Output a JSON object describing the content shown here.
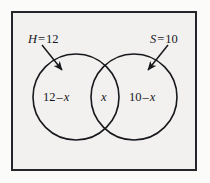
{
  "figure": {
    "frame": {
      "name": "universal-set-rectangle",
      "stroke_color": "#25262a",
      "fill_color": "#f2f1f0"
    },
    "background_color": "#fbfbfa",
    "stroke_color": "#17181b"
  },
  "set_labels": [
    {
      "id": "H",
      "name": "set-h-label",
      "symbol": "H",
      "operator": "=",
      "value": "12",
      "text": "H = 12",
      "arrow": "arrow-to-left-circle"
    },
    {
      "id": "S",
      "name": "set-s-label",
      "symbol": "S",
      "operator": "=",
      "value": "10",
      "text": "S = 10",
      "arrow": "arrow-to-right-circle"
    }
  ],
  "regions": [
    {
      "id": "left-only",
      "name": "left-region-label",
      "lead": "12",
      "operator": "–",
      "var": "x",
      "text": "12 – x"
    },
    {
      "id": "intersection",
      "name": "center-region-label",
      "lead": "",
      "operator": "",
      "var": "x",
      "text": "x"
    },
    {
      "id": "right-only",
      "name": "right-region-label",
      "lead": "10",
      "operator": "–",
      "var": "x",
      "text": "10 – x"
    }
  ],
  "circles": [
    {
      "name": "left-circle",
      "cx": 76,
      "cy": 97,
      "r": 43
    },
    {
      "name": "right-circle",
      "cx": 134,
      "cy": 97,
      "r": 43
    }
  ]
}
